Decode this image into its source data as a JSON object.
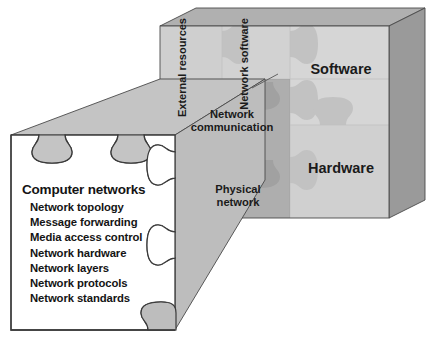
{
  "figure": {
    "colors": {
      "face_light": "#d5d5d5",
      "face_light2": "#cfcfcf",
      "face_mid": "#bdbdbd",
      "face_dark": "#ababab",
      "shade_overlay": "#9d9d9d",
      "piece_fill": "#c2c2c2",
      "piece_fill_light": "#cacaca",
      "top_face": "#b8b8b8",
      "top_face_dark": "#8e8e8e",
      "side_face": "#9a9a9a",
      "wedge": "#c4c4c4",
      "outline": "#3a3a3a",
      "panel_bg": "#ffffff",
      "text": "#141414"
    },
    "cube": {
      "columns": [
        {
          "id": "external-resources",
          "label": "External\nresources",
          "orientation": "vertical"
        },
        {
          "id": "network-software",
          "label": "Network\nsoftware",
          "orientation": "vertical"
        }
      ],
      "rows": [
        {
          "id": "software",
          "label": "Software"
        },
        {
          "id": "hardware",
          "label": "Hardware"
        }
      ],
      "overlay_labels": [
        {
          "id": "network-communication",
          "line1": "Network",
          "line2": "communication"
        },
        {
          "id": "physical-network",
          "line1": "Physical",
          "line2": "network"
        }
      ]
    },
    "panel": {
      "title": "Computer networks",
      "items": [
        "Network topology",
        "Message forwarding",
        "Media access control",
        "Network hardware",
        "Network layers",
        "Network protocols",
        "Network standards"
      ]
    }
  }
}
